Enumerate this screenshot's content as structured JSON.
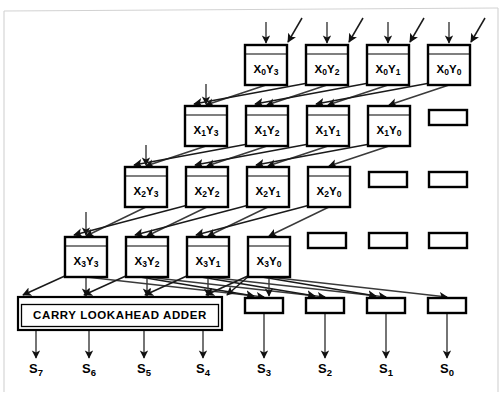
{
  "figure": {
    "type": "block-diagram",
    "width": 502,
    "height": 400,
    "background_color": "#ffffff",
    "line_color": "#000000",
    "wire_color": "#3a3a3a",
    "frame_color": "#d2d2d2"
  },
  "adder": {
    "label": "CARRY LOOKAHEAD ADDER",
    "x": 18,
    "y": 297,
    "width": 204,
    "height": 33
  },
  "geometry": {
    "cell_width": 42,
    "cell_height": 40,
    "cell_header_height": 9,
    "latch_width": 38,
    "latch_height": 15,
    "column_step": 61,
    "row_step": 61
  },
  "cells": [
    {
      "label": "X0Y3",
      "x": 245,
      "y": 45,
      "row": 0,
      "col": 3,
      "x_index": "0",
      "y_index": "3",
      "has_top_input": true,
      "has_diag_input": true
    },
    {
      "label": "X0Y2",
      "x": 306,
      "y": 45,
      "row": 0,
      "col": 2,
      "x_index": "0",
      "y_index": "2",
      "has_top_input": true,
      "has_diag_input": true
    },
    {
      "label": "X0Y1",
      "x": 367,
      "y": 45,
      "row": 0,
      "col": 1,
      "x_index": "0",
      "y_index": "1",
      "has_top_input": true,
      "has_diag_input": true
    },
    {
      "label": "X0Y0",
      "x": 428,
      "y": 45,
      "row": 0,
      "col": 0,
      "x_index": "0",
      "y_index": "0",
      "has_top_input": true,
      "has_diag_input": true
    },
    {
      "label": "X1Y3",
      "x": 185,
      "y": 106,
      "row": 1,
      "col": 3,
      "x_index": "1",
      "y_index": "3",
      "has_top_input": true,
      "has_diag_input": false
    },
    {
      "label": "X1Y2",
      "x": 246,
      "y": 106,
      "row": 1,
      "col": 2,
      "x_index": "1",
      "y_index": "2",
      "has_top_input": false,
      "has_diag_input": false
    },
    {
      "label": "X1Y1",
      "x": 307,
      "y": 106,
      "row": 1,
      "col": 1,
      "x_index": "1",
      "y_index": "1",
      "has_top_input": false,
      "has_diag_input": false
    },
    {
      "label": "X1Y0",
      "x": 368,
      "y": 106,
      "row": 1,
      "col": 0,
      "x_index": "1",
      "y_index": "0",
      "has_top_input": false,
      "has_diag_input": false
    },
    {
      "label": "X2Y3",
      "x": 125,
      "y": 167,
      "row": 2,
      "col": 3,
      "x_index": "2",
      "y_index": "3",
      "has_top_input": true,
      "has_diag_input": false
    },
    {
      "label": "X2Y2",
      "x": 186,
      "y": 167,
      "row": 2,
      "col": 2,
      "x_index": "2",
      "y_index": "2",
      "has_top_input": false,
      "has_diag_input": false
    },
    {
      "label": "X2Y1",
      "x": 247,
      "y": 167,
      "row": 2,
      "col": 1,
      "x_index": "2",
      "y_index": "1",
      "has_top_input": false,
      "has_diag_input": false
    },
    {
      "label": "X2Y0",
      "x": 308,
      "y": 167,
      "row": 2,
      "col": 0,
      "x_index": "2",
      "y_index": "0",
      "has_top_input": false,
      "has_diag_input": false
    },
    {
      "label": "X3Y3",
      "x": 65,
      "y": 237,
      "row": 3,
      "col": 3,
      "x_index": "3",
      "y_index": "3",
      "has_top_input": true,
      "has_diag_input": false
    },
    {
      "label": "X3Y2",
      "x": 126,
      "y": 237,
      "row": 3,
      "col": 2,
      "x_index": "3",
      "y_index": "2",
      "has_top_input": false,
      "has_diag_input": false
    },
    {
      "label": "X3Y1",
      "x": 187,
      "y": 237,
      "row": 3,
      "col": 1,
      "x_index": "3",
      "y_index": "1",
      "has_top_input": false,
      "has_diag_input": false
    },
    {
      "label": "X3Y0",
      "x": 248,
      "y": 237,
      "row": 3,
      "col": 0,
      "x_index": "3",
      "y_index": "0",
      "has_top_input": false,
      "has_diag_input": false
    }
  ],
  "latches": [
    {
      "x": 429,
      "y": 110,
      "row": 1,
      "col": 0
    },
    {
      "x": 369,
      "y": 172,
      "row": 2,
      "col": 1
    },
    {
      "x": 429,
      "y": 172,
      "row": 2,
      "col": 0
    },
    {
      "x": 308,
      "y": 233,
      "row": 3,
      "col": 2
    },
    {
      "x": 369,
      "y": 233,
      "row": 3,
      "col": 1
    },
    {
      "x": 429,
      "y": 233,
      "row": 3,
      "col": 0
    },
    {
      "x": 245,
      "y": 298,
      "row": 4,
      "col": 3
    },
    {
      "x": 306,
      "y": 298,
      "row": 4,
      "col": 2
    },
    {
      "x": 367,
      "y": 298,
      "row": 4,
      "col": 1
    },
    {
      "x": 428,
      "y": 298,
      "row": 4,
      "col": 0
    }
  ],
  "outputs": [
    {
      "label": "S7",
      "sub": "7",
      "x": 36,
      "y": 373,
      "wire_from_y": 331,
      "wire_x": 36
    },
    {
      "label": "S6",
      "sub": "6",
      "x": 89,
      "y": 373,
      "wire_from_y": 331,
      "wire_x": 89
    },
    {
      "label": "S5",
      "sub": "5",
      "x": 144,
      "y": 373,
      "wire_from_y": 331,
      "wire_x": 144
    },
    {
      "label": "S4",
      "sub": "4",
      "x": 203,
      "y": 373,
      "wire_from_y": 331,
      "wire_x": 203
    },
    {
      "label": "S3",
      "sub": "3",
      "x": 264,
      "y": 373,
      "wire_from_y": 314,
      "wire_x": 264
    },
    {
      "label": "S2",
      "sub": "2",
      "x": 325,
      "y": 373,
      "wire_from_y": 314,
      "wire_x": 325
    },
    {
      "label": "S1",
      "sub": "1",
      "x": 386,
      "y": 373,
      "wire_from_y": 314,
      "wire_x": 386
    },
    {
      "label": "S0",
      "sub": "0",
      "x": 447,
      "y": 373,
      "wire_from_y": 314,
      "wire_x": 447
    }
  ],
  "top_inputs": [
    {
      "x": 266,
      "y_start": 22,
      "y_end": 43
    },
    {
      "x": 327,
      "y_start": 22,
      "y_end": 43
    },
    {
      "x": 388,
      "y_start": 22,
      "y_end": 43
    },
    {
      "x": 449,
      "y_start": 22,
      "y_end": 43
    }
  ],
  "top_diagonal_inputs": [
    {
      "x1": 302,
      "y1": 18,
      "x2": 288,
      "y2": 42
    },
    {
      "x1": 363,
      "y1": 18,
      "x2": 349,
      "y2": 42
    },
    {
      "x1": 424,
      "y1": 18,
      "x2": 410,
      "y2": 42
    },
    {
      "x1": 485,
      "y1": 18,
      "x2": 471,
      "y2": 42
    }
  ],
  "side_inputs": [
    {
      "x": 206,
      "y_start": 84,
      "y_end": 104,
      "row": 1
    },
    {
      "x": 146,
      "y_start": 145,
      "y_end": 165,
      "row": 2
    },
    {
      "x": 86,
      "y_start": 212,
      "y_end": 235,
      "row": 3
    }
  ]
}
